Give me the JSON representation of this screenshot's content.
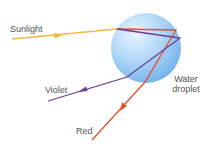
{
  "diagram": {
    "labels": {
      "sunlight": "Sunlight",
      "violet": "Violet",
      "red": "Red",
      "droplet_line1": "Water",
      "droplet_line2": "droplet"
    },
    "colors": {
      "sunlight": "#f5b942",
      "red": "#e8502a",
      "violet": "#6a3d9a",
      "droplet_light": "#dbeeff",
      "droplet_mid": "#a9d2f5",
      "droplet_dark": "#6fb0ea",
      "label": "#555555"
    },
    "droplet": {
      "cx": 146,
      "cy": 48,
      "r": 35
    },
    "rays": {
      "sunlight": {
        "from": [
          12,
          39
        ],
        "to": [
          117,
          29
        ],
        "arrow_at": [
          58,
          35
        ]
      },
      "red": {
        "points": [
          [
            117,
            29
          ],
          [
            176,
            30
          ],
          [
            145,
            82
          ],
          [
            92,
            140
          ]
        ],
        "arrow_at": [
          123,
          107
        ]
      },
      "violet": {
        "points": [
          [
            117,
            29
          ],
          [
            180,
            38
          ],
          [
            127,
            77
          ],
          [
            48,
            101
          ]
        ],
        "arrow_at": [
          82,
          89
        ]
      }
    }
  }
}
